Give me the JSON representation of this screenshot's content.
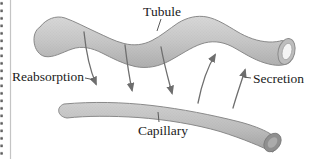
{
  "figure": {
    "type": "renal-tubule-capillary-exchange-diagram",
    "labels": {
      "tubule": "Tubule",
      "reabsorption": "Reabsorption",
      "secretion": "Secretion",
      "capillary": "Capillary"
    },
    "arrows": {
      "reabsorption_count": 3,
      "reabsorption_direction": "downward, from tubule to capillary",
      "secretion_count": 2,
      "secretion_direction": "upward, from capillary to tubule"
    },
    "colors": {
      "background": "#ffffff",
      "tube_fill": "#c6c6c6",
      "tube_fill_dark": "#b0b0b0",
      "tube_outline": "#8a8a8a",
      "tubule_lumen": "#f4f4f4",
      "tubule_opening_ring": "#bdbdbd",
      "capillary_end_face": "#8f8f8f",
      "capillary_end_core": "#ababab",
      "arrow": "#6e6e6e",
      "label_text": "#1b1b1b",
      "perforation_dot": "#5f5f5f",
      "edge_line": "#c4c4c4"
    }
  }
}
